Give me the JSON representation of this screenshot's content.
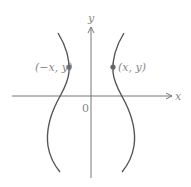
{
  "diagram": {
    "type": "coordinate-plane",
    "axes": {
      "x_label": "x",
      "y_label": "y",
      "origin_label": "0"
    },
    "points": [
      {
        "label": "(−x, y)",
        "side": "left"
      },
      {
        "label": "(x, y)",
        "side": "right"
      }
    ],
    "curves": [
      {
        "name": "left-branch"
      },
      {
        "name": "right-branch"
      }
    ],
    "colors": {
      "axis": "#777777",
      "curve": "#555555",
      "point": "#666666",
      "label": "#888888"
    }
  }
}
